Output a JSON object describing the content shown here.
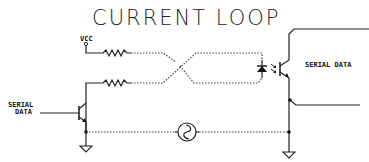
{
  "diagram": {
    "title": "CURRENT LOOP",
    "labels": {
      "vcc": "VCC",
      "serial_data_in_line1": "SERIAL",
      "serial_data_in_line2": "DATA",
      "serial_data_out": "SERIAL DATA"
    },
    "components": [
      {
        "type": "power-supply",
        "label": "VCC"
      },
      {
        "type": "resistor",
        "position": "top"
      },
      {
        "type": "resistor",
        "position": "bottom"
      },
      {
        "type": "npn-transistor",
        "role": "driver"
      },
      {
        "type": "led",
        "role": "optocoupler-emitter"
      },
      {
        "type": "phototransistor",
        "role": "optocoupler-receiver"
      },
      {
        "type": "ac-source",
        "symbol": "~"
      },
      {
        "type": "ground",
        "count": 2
      }
    ],
    "colors": {
      "line": "#222222",
      "background": "#ffffff"
    }
  }
}
